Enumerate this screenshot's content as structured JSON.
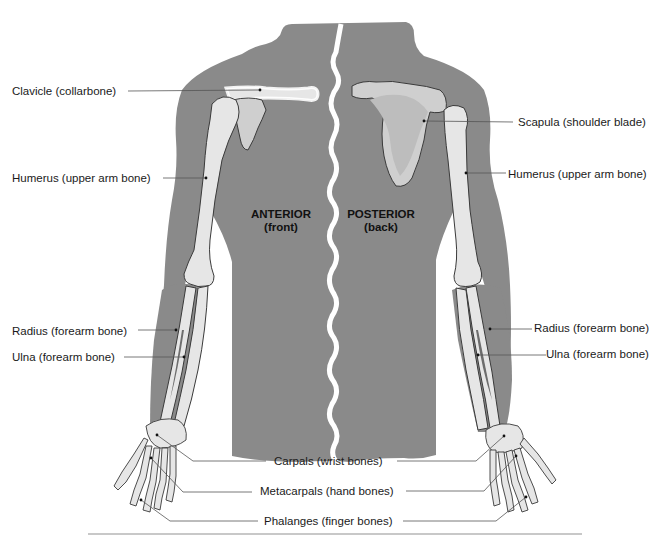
{
  "figure": {
    "colors": {
      "body": "#8a8a8a",
      "bone_fill": "#e6e6e6",
      "bone_shade": "#c9c9c9",
      "bone_outline": "#3a3a3a",
      "halo": "#ffffff",
      "leader": "#555555",
      "spine_gap": "#ffffff",
      "rule": "#c8c8c8"
    },
    "sides": {
      "anterior": {
        "title": "ANTERIOR",
        "subtitle": "(front)"
      },
      "posterior": {
        "title": "POSTERIOR",
        "subtitle": "(back)"
      }
    },
    "labels": {
      "left": [
        {
          "id": "clavicle",
          "text": "Clavicle (collarbone)"
        },
        {
          "id": "humerus",
          "text": "Humerus (upper arm bone)"
        },
        {
          "id": "radius",
          "text": "Radius (forearm bone)"
        },
        {
          "id": "ulna",
          "text": "Ulna (forearm bone)"
        }
      ],
      "right": [
        {
          "id": "scapula",
          "text": "Scapula (shoulder blade)"
        },
        {
          "id": "humerus",
          "text": "Humerus (upper arm bone)"
        },
        {
          "id": "radius",
          "text": "Radius (forearm bone)"
        },
        {
          "id": "ulna",
          "text": "Ulna (forearm bone)"
        }
      ],
      "center": [
        {
          "id": "carpals",
          "text": "Carpals (wrist bones)"
        },
        {
          "id": "metacarpals",
          "text": "Metacarpals (hand bones)"
        },
        {
          "id": "phalanges",
          "text": "Phalanges (finger bones)"
        }
      ]
    }
  }
}
